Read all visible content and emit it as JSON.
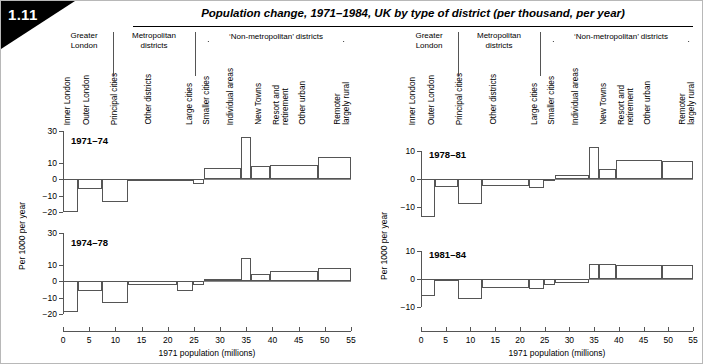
{
  "figure": {
    "number": "1.11",
    "title": "Population change, 1971–1984, UK by type of district (per thousand, per year)"
  },
  "header": {
    "groups": [
      {
        "name": "greater-london",
        "label": "Greater\nLondon"
      },
      {
        "name": "metropolitan-districts",
        "label": "Metropolitan\ndistricts"
      },
      {
        "name": "non-metropolitan-districts",
        "label": "‘Non-metropolitan’ districts"
      }
    ],
    "group_labels": {
      "greater_london": "Greater London",
      "metropolitan_districts": "Metropolitan districts",
      "non_metropolitan": "‘Non-metropolitan’ districts"
    },
    "categories": [
      "Inner London",
      "Outer London",
      "Principal cities",
      "Other districts",
      "Large cities",
      "Smaller cities",
      "Individual areas",
      "New Towns",
      "Resort and retirement",
      "Other urban",
      "Remoter largely rural"
    ]
  },
  "axes": {
    "xlabel": "1971 population (millions)",
    "ylabel": "Per 1000 per year",
    "xticks": [
      0,
      5,
      10,
      15,
      20,
      25,
      30,
      35,
      40,
      45,
      50,
      55
    ],
    "xlim": [
      0,
      55
    ],
    "yticks_left": [
      30,
      10,
      0,
      -10,
      -20
    ],
    "yticks_right": [
      10,
      0,
      -10
    ],
    "ylim_left": [
      -22,
      30
    ],
    "ylim_right": [
      -15,
      13
    ]
  },
  "chart_data": [
    {
      "type": "bar",
      "name": "panel-1971-74",
      "title": "1971–74",
      "xlabel": "1971 population (millions)",
      "ylabel": "Per 1000 per year",
      "xlim": [
        0,
        55
      ],
      "ylim": [
        -22,
        30
      ],
      "grid": false,
      "note": "Variable-width bars: width = 1971 population (millions), height = population change per 1000 per year",
      "bars": [
        {
          "category": "Inner London",
          "x0": 0.0,
          "x1": 2.8,
          "width": 2.8,
          "value": -20.0
        },
        {
          "category": "Outer London",
          "x0": 2.8,
          "x1": 7.5,
          "width": 4.7,
          "value": -5.8
        },
        {
          "category": "Principal cities",
          "x0": 7.5,
          "x1": 12.4,
          "width": 4.9,
          "value": -14.0
        },
        {
          "category": "Other districts",
          "x0": 12.4,
          "x1": 21.8,
          "width": 9.4,
          "value": 0.5
        },
        {
          "category": "Large cities",
          "x0": 21.8,
          "x1": 24.9,
          "width": 3.1,
          "value": 0.5
        },
        {
          "category": "Smaller cities",
          "x0": 24.9,
          "x1": 27.0,
          "width": 2.1,
          "value": -2.6
        },
        {
          "category": "Individual areas",
          "x0": 27.0,
          "x1": 34.0,
          "width": 7.0,
          "value": 7.4
        },
        {
          "category": "New Towns",
          "x0": 34.0,
          "x1": 35.9,
          "width": 1.9,
          "value": 26.5
        },
        {
          "category": "Resort and retirement",
          "x0": 35.9,
          "x1": 39.5,
          "width": 3.6,
          "value": 8.6
        },
        {
          "category": "Other urban",
          "x0": 39.5,
          "x1": 48.7,
          "width": 9.2,
          "value": 9.0
        },
        {
          "category": "Remoter largely rural",
          "x0": 48.7,
          "x1": 55.0,
          "width": 6.3,
          "value": 14.0
        }
      ]
    },
    {
      "type": "bar",
      "name": "panel-1974-78",
      "title": "1974–78",
      "xlabel": "1971 population (millions)",
      "ylabel": "Per 1000 per year",
      "xlim": [
        0,
        55
      ],
      "ylim": [
        -22,
        30
      ],
      "grid": false,
      "note": "Variable-width bars: width = 1971 population (millions), height = population change per 1000 per year",
      "bars": [
        {
          "category": "Inner London",
          "x0": 0.0,
          "x1": 2.8,
          "width": 2.8,
          "value": -18.8
        },
        {
          "category": "Outer London",
          "x0": 2.8,
          "x1": 7.5,
          "width": 4.7,
          "value": -6.2
        },
        {
          "category": "Principal cities",
          "x0": 7.5,
          "x1": 12.4,
          "width": 4.9,
          "value": -13.6
        },
        {
          "category": "Other districts",
          "x0": 12.4,
          "x1": 21.8,
          "width": 9.4,
          "value": -2.4
        },
        {
          "category": "Large cities",
          "x0": 21.8,
          "x1": 24.9,
          "width": 3.1,
          "value": -6.2
        },
        {
          "category": "Smaller cities",
          "x0": 24.9,
          "x1": 27.0,
          "width": 2.1,
          "value": -2.0
        },
        {
          "category": "Individual areas",
          "x0": 27.0,
          "x1": 34.0,
          "width": 7.0,
          "value": 1.6
        },
        {
          "category": "New Towns",
          "x0": 34.0,
          "x1": 35.9,
          "width": 1.9,
          "value": 14.8
        },
        {
          "category": "Resort and retirement",
          "x0": 35.9,
          "x1": 39.5,
          "width": 3.6,
          "value": 4.6
        },
        {
          "category": "Other urban",
          "x0": 39.5,
          "x1": 48.7,
          "width": 9.2,
          "value": 6.6
        },
        {
          "category": "Remoter largely rural",
          "x0": 48.7,
          "x1": 55.0,
          "width": 6.3,
          "value": 8.4
        }
      ]
    },
    {
      "type": "bar",
      "name": "panel-1978-81",
      "title": "1978–81",
      "xlabel": "1971 population (millions)",
      "ylabel": "Per 1000 per year",
      "xlim": [
        0,
        55
      ],
      "ylim": [
        -15,
        13
      ],
      "grid": false,
      "note": "Variable-width bars: width = 1971 population (millions), height = population change per 1000 per year",
      "bars": [
        {
          "category": "Inner London",
          "x0": 0.0,
          "x1": 2.8,
          "width": 2.8,
          "value": -13.4
        },
        {
          "category": "Outer London",
          "x0": 2.8,
          "x1": 7.5,
          "width": 4.7,
          "value": -2.8
        },
        {
          "category": "Principal cities",
          "x0": 7.5,
          "x1": 12.4,
          "width": 4.9,
          "value": -9.0
        },
        {
          "category": "Other districts",
          "x0": 12.4,
          "x1": 21.8,
          "width": 9.4,
          "value": -2.4
        },
        {
          "category": "Large cities",
          "x0": 21.8,
          "x1": 24.9,
          "width": 3.1,
          "value": -3.0
        },
        {
          "category": "Smaller cities",
          "x0": 24.9,
          "x1": 27.0,
          "width": 2.1,
          "value": -0.8
        },
        {
          "category": "Individual areas",
          "x0": 27.0,
          "x1": 34.0,
          "width": 7.0,
          "value": 1.4
        },
        {
          "category": "New Towns",
          "x0": 34.0,
          "x1": 35.9,
          "width": 1.9,
          "value": 11.4
        },
        {
          "category": "Resort and retirement",
          "x0": 35.9,
          "x1": 39.5,
          "width": 3.6,
          "value": 3.6
        },
        {
          "category": "Other urban",
          "x0": 39.5,
          "x1": 48.7,
          "width": 9.2,
          "value": 6.8
        },
        {
          "category": "Remoter largely rural",
          "x0": 48.7,
          "x1": 55.0,
          "width": 6.3,
          "value": 6.4
        }
      ]
    },
    {
      "type": "bar",
      "name": "panel-1981-84",
      "title": "1981–84",
      "xlabel": "1971 population (millions)",
      "ylabel": "Per 1000 per year",
      "xlim": [
        0,
        55
      ],
      "ylim": [
        -15,
        13
      ],
      "grid": false,
      "note": "Variable-width bars: width = 1971 population (millions), height = population change per 1000 per year",
      "bars": [
        {
          "category": "Inner London",
          "x0": 0.0,
          "x1": 2.8,
          "width": 2.8,
          "value": -6.0
        },
        {
          "category": "Outer London",
          "x0": 2.8,
          "x1": 7.5,
          "width": 4.7,
          "value": -0.4
        },
        {
          "category": "Principal cities",
          "x0": 7.5,
          "x1": 12.4,
          "width": 4.9,
          "value": -7.0
        },
        {
          "category": "Other districts",
          "x0": 12.4,
          "x1": 21.8,
          "width": 9.4,
          "value": -3.2
        },
        {
          "category": "Large cities",
          "x0": 21.8,
          "x1": 24.9,
          "width": 3.1,
          "value": -3.6
        },
        {
          "category": "Smaller cities",
          "x0": 24.9,
          "x1": 27.0,
          "width": 2.1,
          "value": -2.2
        },
        {
          "category": "Individual areas",
          "x0": 27.0,
          "x1": 34.0,
          "width": 7.0,
          "value": -1.4
        },
        {
          "category": "New Towns",
          "x0": 34.0,
          "x1": 35.9,
          "width": 1.9,
          "value": 5.6
        },
        {
          "category": "Resort and retirement",
          "x0": 35.9,
          "x1": 39.5,
          "width": 3.6,
          "value": 5.6
        },
        {
          "category": "Other urban",
          "x0": 39.5,
          "x1": 48.7,
          "width": 9.2,
          "value": 5.2
        },
        {
          "category": "Remoter largely rural",
          "x0": 48.7,
          "x1": 55.0,
          "width": 6.3,
          "value": 5.2
        }
      ]
    }
  ],
  "colors": {
    "bar_stroke": "#555555",
    "axis": "#555555",
    "text": "#000000",
    "badge_bg": "#000000",
    "badge_text": "#ffffff",
    "page_border": "#b8b8b8"
  }
}
